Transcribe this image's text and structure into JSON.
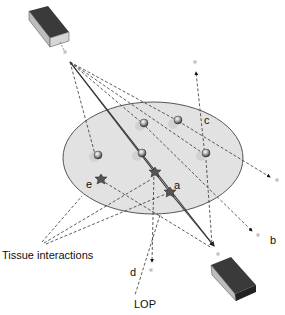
{
  "diagram": {
    "type": "PET coincidence / scatter illustration",
    "labels": {
      "a": "a",
      "b": "b",
      "c": "c",
      "d": "d",
      "e": "e",
      "tissue_interactions": "Tissue interactions",
      "lop": "LOP"
    },
    "colors": {
      "ellipse_fill": "#e2e2e2",
      "ellipse_stroke": "#555555",
      "detector_dark": "#3a3a3a",
      "detector_side": "#bdbdbd",
      "line": "#333333",
      "photon_dot": "#888888"
    },
    "elements": {
      "detectors": [
        "top-left detector",
        "bottom-right detector"
      ],
      "tissue_ellipse": "tissue",
      "annihilation_sources": 6,
      "scatter_events": 3
    }
  }
}
